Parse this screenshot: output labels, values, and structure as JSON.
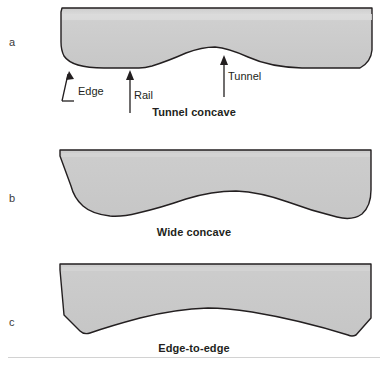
{
  "figure": {
    "title_present": false,
    "background_color": "#ffffff",
    "shape_fill": "#c9c9c9",
    "shape_fill_light": "#d8d8d8",
    "shape_stroke": "#231f20",
    "divider_color": "#d2d2d2"
  },
  "panels": [
    {
      "letter": "a",
      "caption": "Tunnel concave",
      "annotations": [
        {
          "label": "Edge",
          "icon": "elbow-arrow-up-right-icon"
        },
        {
          "label": "Rail",
          "icon": "arrow-up-icon"
        },
        {
          "label": "Tunnel",
          "icon": "arrow-up-icon"
        }
      ]
    },
    {
      "letter": "b",
      "caption": "Wide concave",
      "annotations": []
    },
    {
      "letter": "c",
      "caption": "Edge-to-edge",
      "annotations": []
    }
  ]
}
